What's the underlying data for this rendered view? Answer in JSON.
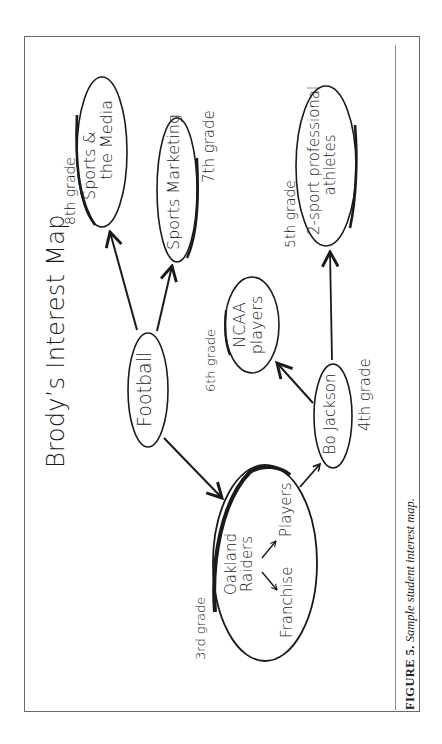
{
  "title": "Brody’s Interest Map",
  "caption": {
    "label": "FIGURE 5.",
    "text": "Sample student interest map."
  },
  "nodes": {
    "football": {
      "label": "Football"
    },
    "media": {
      "line1": "Sports &",
      "line2": "the Media",
      "grade": "8th grade"
    },
    "marketing": {
      "label": "Sports Marketing",
      "grade": "7th grade"
    },
    "raiders": {
      "line1": "Oakland",
      "line2": "Raiders",
      "grade": "3rd grade",
      "sub_players": "Players",
      "sub_franchise": "Franchise"
    },
    "bojackson": {
      "label": "Bo Jackson",
      "grade": "4th grade"
    },
    "ncaa": {
      "line1": "NCAA",
      "line2": "players",
      "grade": "6th grade"
    },
    "twosport": {
      "line1": "2-sport professional",
      "line2": "athletes",
      "grade": "5th grade"
    }
  },
  "edges": [
    {
      "from": "Football",
      "to": "Sports & the Media"
    },
    {
      "from": "Football",
      "to": "Sports Marketing"
    },
    {
      "from": "Football",
      "to": "Oakland Raiders"
    },
    {
      "from": "Oakland Raiders",
      "to": "Bo Jackson"
    },
    {
      "from": "Oakland Raiders",
      "to": "Players"
    },
    {
      "from": "Oakland Raiders",
      "to": "Franchise"
    },
    {
      "from": "Bo Jackson",
      "to": "NCAA players"
    },
    {
      "from": "Bo Jackson",
      "to": "2-sport professional athletes"
    }
  ],
  "colors": {
    "ink": "#1a1a1a",
    "frame": "#6a6a6a"
  }
}
